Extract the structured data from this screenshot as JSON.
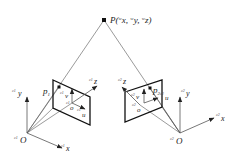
{
  "figure": {
    "type": "stereo-camera-projection-diagram",
    "colors": {
      "line": "#555555",
      "plane": "#111111",
      "text": "#222222",
      "background": "#ffffff"
    },
    "world_point": {
      "name": "P",
      "label": "P(",
      "coords": [
        {
          "sup": "w",
          "var": "x",
          "sep": ", "
        },
        {
          "sup": "w",
          "var": "y",
          "sep": ", "
        },
        {
          "sup": "w",
          "var": "z",
          "sep": ")"
        }
      ]
    },
    "left_camera": {
      "prefix": "c1",
      "origin_label": "O",
      "x_label": "x",
      "y_label": "y",
      "z_label": "z",
      "image_point": "p",
      "image_point_sub": "1",
      "image_origin": "o",
      "u_label": "u",
      "v_label": "v"
    },
    "right_camera": {
      "prefix": "c2",
      "origin_label": "O",
      "x_label": "x",
      "y_label": "y",
      "z_label": "z",
      "image_point": "p",
      "image_point_sub": "2",
      "image_origin": "o",
      "u_label": "u",
      "v_label": "v"
    }
  }
}
